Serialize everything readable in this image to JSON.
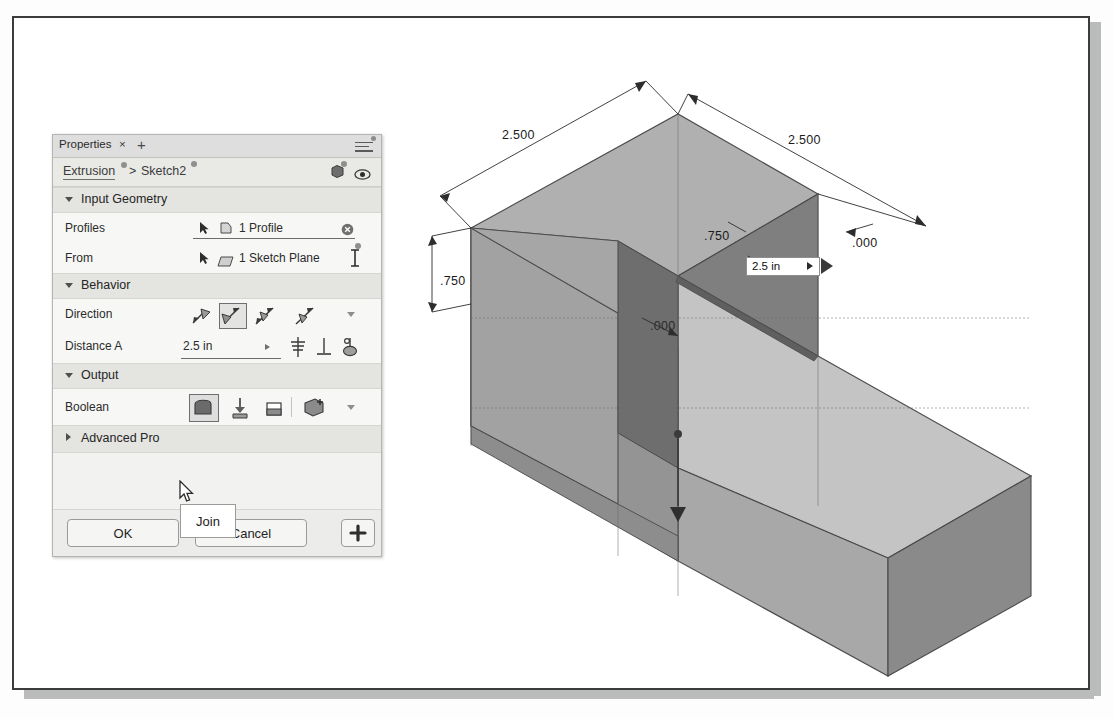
{
  "app": {
    "panel_title": "Properties",
    "close_label": "×",
    "add_label": "+",
    "menu_icon": "hamburger-menu-icon"
  },
  "breadcrumb": {
    "parent": "Extrusion",
    "separator": ">",
    "current": "Sketch2",
    "icon_cube": "cube-icon",
    "icon_eye": "eye-icon"
  },
  "sections": {
    "input_geometry": {
      "label": "Input Geometry",
      "expanded": true,
      "rows": {
        "profiles": {
          "label": "Profiles",
          "value": "1 Profile",
          "select_icon": "arrow-select-icon",
          "type_icon": "profile-icon",
          "clear_icon": "clear-selection-icon"
        },
        "from": {
          "label": "From",
          "value": "1 Sketch Plane",
          "select_icon": "arrow-select-icon",
          "type_icon": "plane-icon",
          "end_icon": "i-beam-icon"
        }
      }
    },
    "behavior": {
      "label": "Behavior",
      "expanded": true,
      "direction": {
        "label": "Direction",
        "options": [
          "one-side",
          "two-side-symmetric",
          "symmetric",
          "asymmetric"
        ],
        "selected_index": 1,
        "overflow_icon": "chevron-down-icon"
      },
      "distance_a": {
        "label": "Distance A",
        "value": "2.5 in",
        "expand_icon": "chevron-right-icon",
        "taper_icon": "taper-angle-icon",
        "measure_icon": "measure-icon",
        "to_icon": "extent-to-icon"
      }
    },
    "output": {
      "label": "Output",
      "expanded": true,
      "boolean": {
        "label": "Boolean",
        "options": [
          "Join",
          "Cut",
          "Intersect",
          "New Body"
        ],
        "selected_index": 0,
        "overflow_icon": "chevron-down-icon"
      }
    },
    "advanced_properties": {
      "label": "Advanced Pro",
      "expanded": false
    }
  },
  "tooltip": {
    "text": "Join"
  },
  "buttons": {
    "ok": "OK",
    "cancel": "Cancel",
    "plus": "+"
  },
  "canvas": {
    "value_box": {
      "value": "2.5 in",
      "arrow_icon": "play-arrow-icon",
      "drag_handle_icon": "drag-arrow-icon"
    },
    "dimensions": [
      {
        "id": "top-left-width",
        "text": "2.500",
        "x": 497,
        "y": 100
      },
      {
        "id": "top-right-width",
        "text": "2.500",
        "x": 772,
        "y": 105
      },
      {
        "id": "left-depth",
        "text": ".750",
        "x": 432,
        "y": 246
      },
      {
        "id": "right-depth",
        "text": ".750",
        "x": 690,
        "y": 201
      },
      {
        "id": "right-offset",
        "text": ".000",
        "x": 836,
        "y": 209
      },
      {
        "id": "center-offset",
        "text": ".000",
        "x": 636,
        "y": 291
      }
    ]
  },
  "colors": {
    "panel_bg": "#f2f2f0",
    "section_bg": "#e4e4e1",
    "row_bg": "#f7f7f5",
    "frame_border": "#3c3c3c",
    "model_top": "#b4b4b4",
    "model_left": "#9a9a9a",
    "model_right": "#8c8c8c",
    "model_dark": "#6f6f6f",
    "shadow": "#b9bcbb"
  }
}
